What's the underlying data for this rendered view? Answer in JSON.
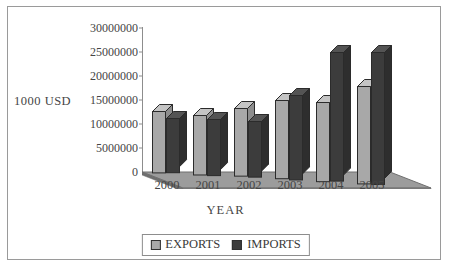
{
  "chart_data": {
    "type": "bar",
    "title": "",
    "subtitle": "",
    "xlabel": "YEAR",
    "ylabel": "1000  USD",
    "categories": [
      "2000",
      "2001",
      "2002",
      "2003",
      "2004",
      "2005"
    ],
    "series": [
      {
        "name": "EXPORTS",
        "color": "#a8a8a8",
        "values": [
          13000000,
          12600000,
          14300000,
          16500000,
          16700000,
          20500000
        ]
      },
      {
        "name": "IMPORTS",
        "color": "#3c3c3c",
        "values": [
          11500000,
          11900000,
          11800000,
          17800000,
          27000000,
          27700000
        ]
      }
    ],
    "yticks": [
      0,
      5000000,
      10000000,
      15000000,
      20000000,
      25000000,
      30000000
    ],
    "ytick_labels": [
      "0",
      "5000000",
      "10000000",
      "15000000",
      "20000000",
      "25000000",
      "30000000"
    ],
    "ylim": [
      0,
      30000000
    ],
    "grid": false,
    "legend_position": "bottom",
    "three_d": true
  },
  "legend": {
    "items": [
      {
        "label": "EXPORTS",
        "color": "#a8a8a8"
      },
      {
        "label": "IMPORTS",
        "color": "#3c3c3c"
      }
    ]
  },
  "colors": {
    "frame_border": "#9a9a9a",
    "axis": "#8d8d8d",
    "text": "#454545",
    "floor_top": "#9e9e9e",
    "floor_front": "#7e7e7e",
    "exports": "#a8a8a8",
    "imports": "#3c3c3c"
  }
}
